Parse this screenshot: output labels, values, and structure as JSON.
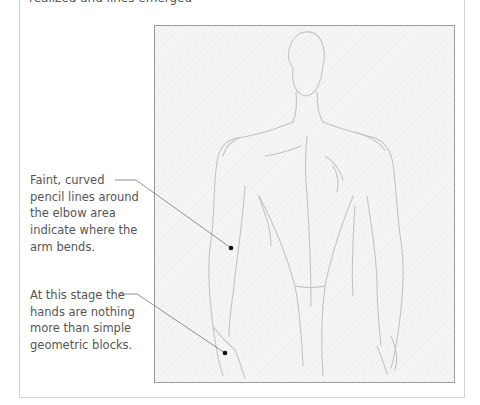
{
  "intro_text_partial": "realized and lines emerged",
  "figure": {
    "stroke_color": "#bdbdbd",
    "frame_border_color": "#9a9a9a"
  },
  "callouts": [
    {
      "text": "Faint, curved pencil lines around the elbow area indicate where the arm bends."
    },
    {
      "text": "At this stage the hands are nothing more than simple geometric blocks."
    }
  ],
  "colors": {
    "text": "#555555",
    "leader_line": "#777777",
    "dot": "#111111",
    "outer_border": "#d2d2d2"
  }
}
